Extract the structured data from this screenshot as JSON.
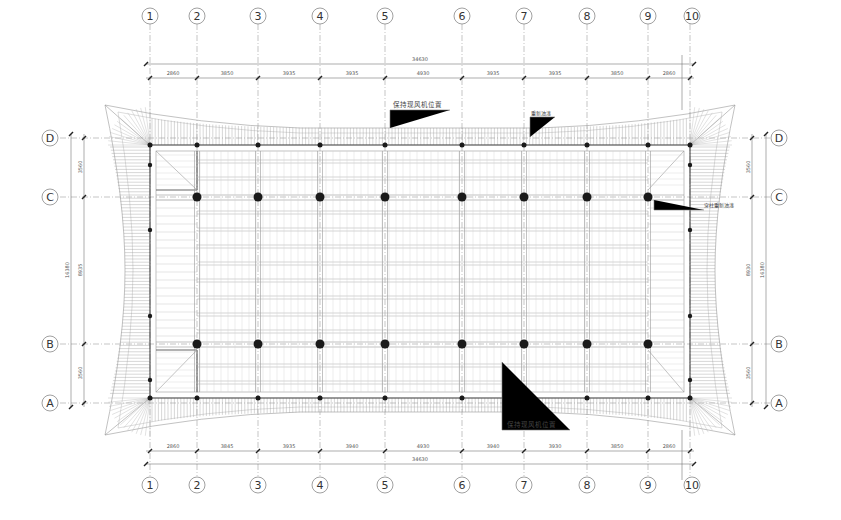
{
  "drawing": {
    "type": "roof framing plan",
    "line_color": "#555555",
    "column_color": "#1a1a1a"
  },
  "axes": {
    "columns": [
      {
        "label": "1",
        "x": 150
      },
      {
        "label": "2",
        "x": 197
      },
      {
        "label": "3",
        "x": 258
      },
      {
        "label": "4",
        "x": 320
      },
      {
        "label": "5",
        "x": 385
      },
      {
        "label": "6",
        "x": 462
      },
      {
        "label": "7",
        "x": 524
      },
      {
        "label": "8",
        "x": 587
      },
      {
        "label": "9",
        "x": 648
      },
      {
        "label": "10",
        "x": 690
      }
    ],
    "rows": [
      {
        "label": "D",
        "y": 138
      },
      {
        "label": "C",
        "y": 197
      },
      {
        "label": "B",
        "y": 344
      },
      {
        "label": "A",
        "y": 403
      }
    ]
  },
  "dimensions": {
    "top_overall": "34630",
    "top_segments": [
      "2860",
      "3850",
      "3935",
      "3935",
      "4930",
      "3935",
      "3935",
      "3850",
      "2860"
    ],
    "bottom_overall": "34630",
    "bottom_segments": [
      "2860",
      "3845",
      "3935",
      "3940",
      "4930",
      "3940",
      "3930",
      "3850",
      "2860"
    ],
    "left_overall": "16380",
    "left_segments": [
      "3560",
      "8935",
      "3560"
    ],
    "right_overall": "16380",
    "right_segments": [
      "3560",
      "8930",
      "3560"
    ]
  },
  "annotations": {
    "top_note": "保持现风机位置",
    "top_small_note": "重新油漆",
    "right_note": "穿柱重新油漆",
    "bottom_note": "保持现风机位置"
  }
}
